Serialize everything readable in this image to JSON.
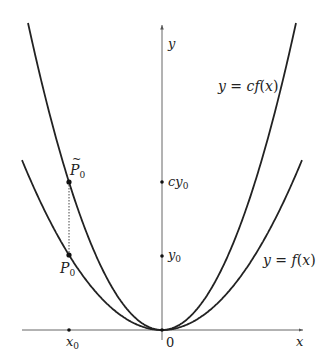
{
  "figure": {
    "axes": {
      "x_label": "x",
      "y_label": "y",
      "origin_label": "0"
    },
    "curves": [
      {
        "name": "f",
        "label": "y = f(x)",
        "label_parts": [
          "y",
          " = ",
          "f",
          "(",
          "x",
          ")"
        ]
      },
      {
        "name": "cf",
        "label": "y = cf(x)",
        "label_parts": [
          "y",
          " = ",
          "c",
          "f",
          "(",
          "x",
          ")"
        ]
      }
    ],
    "points": {
      "P0": {
        "label_main": "P",
        "label_sub": "0"
      },
      "P0_tilde": {
        "label_main": "P",
        "label_sub": "0",
        "accent": "~"
      }
    },
    "ticks": {
      "x0": {
        "main": "x",
        "sub": "0"
      },
      "y0": {
        "main": "y",
        "sub": "0"
      },
      "cy0": {
        "main": "cy",
        "sub": "0"
      }
    },
    "colors": {
      "curve": "#222222",
      "axis": "#555555",
      "guide": "#444444"
    }
  }
}
